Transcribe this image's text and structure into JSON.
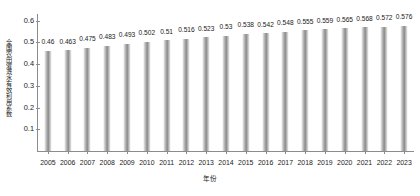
{
  "chart_data": {
    "type": "bar",
    "title": "",
    "xlabel": "年份",
    "ylabel": "全国农田灌溉水有效利用系数",
    "categories": [
      "2005",
      "2006",
      "2007",
      "2008",
      "2009",
      "2010",
      "2011",
      "2012",
      "2013",
      "2014",
      "2015",
      "2016",
      "2017",
      "2018",
      "2019",
      "2020",
      "2021",
      "2022",
      "2023"
    ],
    "values": [
      0.46,
      0.463,
      0.475,
      0.483,
      0.493,
      0.502,
      0.51,
      0.516,
      0.523,
      0.53,
      0.538,
      0.542,
      0.548,
      0.555,
      0.559,
      0.565,
      0.568,
      0.572,
      0.576
    ],
    "value_labels": [
      "0.46",
      "0.463",
      "0.475",
      "0.483",
      "0.493",
      "0.502",
      "0.51",
      "0.516",
      "0.523",
      "0.53",
      "0.538",
      "0.542",
      "0.548",
      "0.555",
      "0.559",
      "0.565",
      "0.568",
      "0.572",
      "0.576"
    ],
    "ylim": [
      0,
      0.63
    ],
    "yticks": [
      0.1,
      0.2,
      0.3,
      0.4,
      0.5,
      0.6
    ],
    "ytick_labels": [
      "0.1",
      "0.2",
      "0.3",
      "0.4",
      "0.5",
      "0.6"
    ],
    "grid": false,
    "legend": null,
    "bar_color": "#9a9a9a"
  }
}
